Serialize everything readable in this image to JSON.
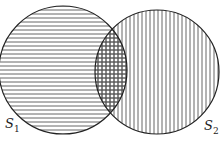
{
  "diagram": {
    "type": "venn",
    "stroke_color": "#222222",
    "hatch_color": "#555555",
    "background": "#ffffff",
    "sets": [
      {
        "id": "S1",
        "label_base": "S",
        "label_sub": "1",
        "cx": 63,
        "cy": 70,
        "r": 64,
        "fill_pattern": "horizontal-lines",
        "label_pos": {
          "x": 5,
          "y": 117
        }
      },
      {
        "id": "S2",
        "label_base": "S",
        "label_sub": "2",
        "cx": 157,
        "cy": 72,
        "r": 62,
        "fill_pattern": "vertical-lines",
        "label_pos": {
          "x": 204,
          "y": 119
        }
      }
    ],
    "intersection": {
      "fill_pattern": "crosshatch",
      "description": "S1 ∩ S2"
    }
  }
}
